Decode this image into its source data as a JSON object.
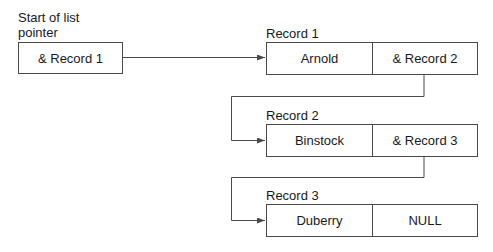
{
  "diagram": {
    "start_pointer": {
      "label_line1": "Start of list",
      "label_line2": "pointer",
      "value": "& Record 1"
    },
    "records": [
      {
        "label": "Record 1",
        "data": "Arnold",
        "next": "& Record 2"
      },
      {
        "label": "Record 2",
        "data": "Binstock",
        "next": "& Record 3"
      },
      {
        "label": "Record 3",
        "data": "Duberry",
        "next": "NULL"
      }
    ],
    "colors": {
      "line": "#4a4a4a",
      "text": "#1a1a1a",
      "background": "#ffffff"
    }
  }
}
